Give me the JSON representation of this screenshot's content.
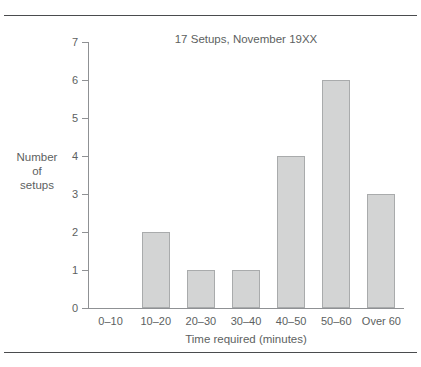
{
  "figure": {
    "clipped_top_text": "",
    "rules": [
      "top",
      "bottom"
    ]
  },
  "chart_data": {
    "type": "bar",
    "title": "17 Setups, November 19XX",
    "xlabel": "Time required (minutes)",
    "ylabel": "Number of setups",
    "ylabel_lines": [
      "Number",
      "of",
      "setups"
    ],
    "categories": [
      "0–10",
      "10–20",
      "20–30",
      "30–40",
      "40–50",
      "50–60",
      "Over 60"
    ],
    "values": [
      0,
      2,
      1,
      1,
      4,
      6,
      3
    ],
    "ylim": [
      0,
      7
    ],
    "yticks": [
      0,
      1,
      2,
      3,
      4,
      5,
      6,
      7
    ],
    "ytick_labels": [
      "0",
      "1",
      "2",
      "3",
      "4",
      "5",
      "6",
      "7"
    ],
    "grid": false,
    "legend": false,
    "bar_fill_color": "#d3d4d4",
    "bar_edge_color": "#a9abac",
    "axis_color": "#8f9194",
    "text_color": "#5d5f61",
    "rule_color": "#4a4c4e",
    "total_setups": 17
  }
}
